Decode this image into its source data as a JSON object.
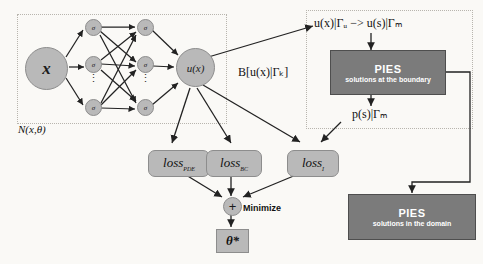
{
  "diagram": {
    "title_hidden": "PINN-PIES architecture",
    "network": {
      "input_label": "x",
      "hidden_activation_label": "σ",
      "output_label": "u(x)",
      "panel_caption": "N(x,θ)",
      "vertical_ellipsis": "⋮"
    },
    "boundary_panel": {
      "mapping_equation": "u(x)|Γᵤ −> u(s)|Γₘ",
      "pies_title": "PIES",
      "pies_subtitle": "solutions at the boundary",
      "output_equation": "p(s)|Γₘ"
    },
    "operator_label": "B[u(x)|Γₖ]",
    "losses": [
      {
        "name": "loss",
        "subscript": "PDE"
      },
      {
        "name": "loss",
        "subscript": "BC"
      },
      {
        "name": "loss",
        "subscript": "I"
      }
    ],
    "sum_symbol": "+",
    "minimize_label": "Minimize",
    "parameters_label": "θ*",
    "domain_panel": {
      "pies_title": "PIES",
      "pies_subtitle": "solutions in the domain"
    },
    "colors": {
      "node_fill": "#b9b9b9",
      "pies_fill": "#7b7b7b",
      "stroke": "#222222",
      "background": "#faf9f6",
      "panel_border": "#b8b5ae"
    }
  }
}
